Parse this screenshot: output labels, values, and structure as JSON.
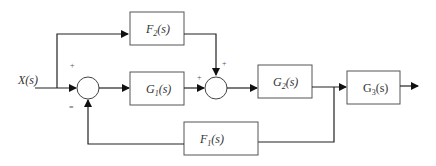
{
  "diagram": {
    "type": "block-diagram",
    "input": {
      "label": "X(s)"
    },
    "blocks": [
      {
        "id": "F2",
        "label": "F",
        "sub": "2",
        "suffix": "(s)"
      },
      {
        "id": "G1",
        "label": "G",
        "sub": "1",
        "suffix": "(s)"
      },
      {
        "id": "G2",
        "label": "G",
        "sub": "2",
        "suffix": "(s)"
      },
      {
        "id": "G3",
        "label": "G",
        "sub": "3",
        "suffix": "(s)"
      },
      {
        "id": "F1",
        "label": "F",
        "sub": "1",
        "suffix": "(s)"
      }
    ],
    "summing_junctions": [
      {
        "id": "S1",
        "signs": [
          "+",
          "="
        ]
      },
      {
        "id": "S2",
        "signs": [
          "+",
          "+"
        ]
      }
    ],
    "connections": [
      "X(s) -> S1 (+)",
      "X(s) -> F2",
      "S1 -> G1",
      "G1 -> S2 (+)",
      "F2 -> S2 (+)",
      "S2 -> G2",
      "G2 -> G3",
      "G2 output -> F1",
      "F1 -> S1 (-)",
      "G3 -> output"
    ]
  }
}
